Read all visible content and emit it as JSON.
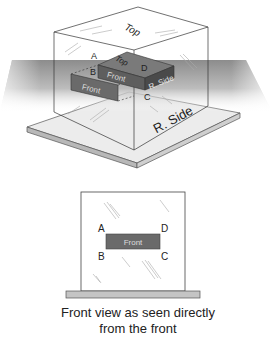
{
  "figure": {
    "iso_view": {
      "labels": {
        "cube_top": "Top",
        "cube_right_side": "R. Side",
        "block_top": "Top",
        "block_front": "Front",
        "block_right_side": "R. Side",
        "projected_front": "Front"
      },
      "corners": [
        "A",
        "B",
        "C",
        "D"
      ]
    },
    "front_view": {
      "labels": {
        "block_front": "Front"
      },
      "corners": [
        "A",
        "B",
        "C",
        "D"
      ]
    },
    "caption": {
      "line1": "Front view as seen directly",
      "line2": "from the front"
    },
    "colors": {
      "block_dark": "#5e5e5e",
      "block_top": "#7a7a7a",
      "block_side": "#4a4a4a",
      "plane_gray": "#9a9a9a",
      "base_plate": "#e8e8e8",
      "base_edge": "#b5b5b5",
      "line": "#333333"
    }
  }
}
